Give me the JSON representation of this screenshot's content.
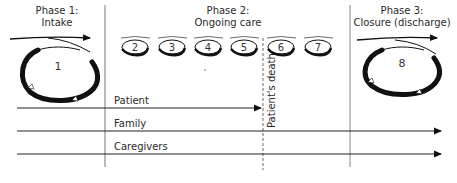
{
  "phases": [
    {
      "line1": "Phase 1:",
      "line2": "Intake"
    },
    {
      "line1": "Phase 2:",
      "line2": "Ongoing care"
    },
    {
      "line1": "Phase 3:",
      "line2": "Closure (discharge)"
    }
  ],
  "cycles": {
    "intake": "1",
    "ongoing": [
      "2",
      "3",
      "4",
      "5",
      "6",
      "7"
    ],
    "closure": "8"
  },
  "event": {
    "label": "Patient's death"
  },
  "tracks": [
    {
      "label": "Patient",
      "ends_at": "Patient's death"
    },
    {
      "label": "Family",
      "ends_at": "end"
    },
    {
      "label": "Caregivers",
      "ends_at": "end"
    }
  ],
  "colors": {
    "ink": "#111111",
    "divider": "#888888",
    "text": "#2a2a2a"
  }
}
